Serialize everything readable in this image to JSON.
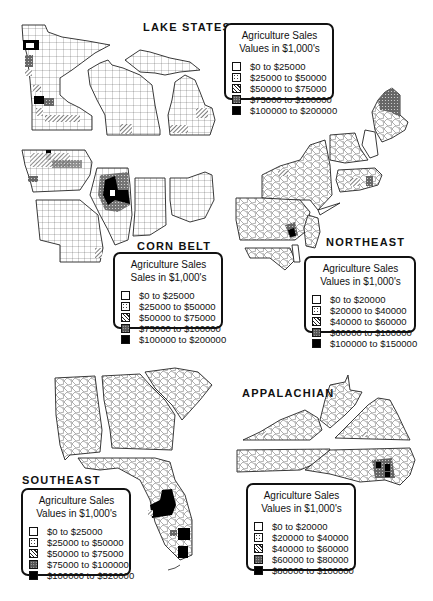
{
  "figure": "Agriculture sales by county, five regional maps",
  "regions": [
    {
      "id": "lake_states",
      "title": "LAKE STATES",
      "states": [
        "Minnesota",
        "Wisconsin",
        "Michigan"
      ],
      "legend": {
        "title_line1": "Agriculture Sales",
        "title_line2": "Values in $1,000's",
        "items": [
          {
            "label": "$0 to $25000",
            "pattern": "white"
          },
          {
            "label": "$25000 to $50000",
            "pattern": "dotted"
          },
          {
            "label": "$50000 to $75000",
            "pattern": "hatched"
          },
          {
            "label": "$75000 to $100000",
            "pattern": "crosshatch"
          },
          {
            "label": "$100000 to $200000",
            "pattern": "black"
          }
        ]
      }
    },
    {
      "id": "corn_belt",
      "title": "CORN BELT",
      "states": [
        "Iowa",
        "Missouri",
        "Illinois",
        "Indiana",
        "Ohio"
      ],
      "legend": {
        "title_line1": "Agriculture Sales",
        "title_line2": "Sales in $1,000's",
        "items": [
          {
            "label": "$0 to $25000",
            "pattern": "white"
          },
          {
            "label": "$25000 to $50000",
            "pattern": "dotted"
          },
          {
            "label": "$50000 to $75000",
            "pattern": "hatched"
          },
          {
            "label": "$75000 to $100000",
            "pattern": "crosshatch"
          },
          {
            "label": "$100000 to $200000",
            "pattern": "black"
          }
        ]
      }
    },
    {
      "id": "northeast",
      "title": "NORTHEAST",
      "states": [
        "Maine",
        "New Hampshire",
        "Vermont",
        "Massachusetts",
        "Rhode Island",
        "Connecticut",
        "New York",
        "New Jersey",
        "Pennsylvania",
        "Delaware",
        "Maryland"
      ],
      "legend": {
        "title_line1": "Agriculture Sales",
        "title_line2": "Values in $1,000's",
        "items": [
          {
            "label": "$0 to $20000",
            "pattern": "white"
          },
          {
            "label": "$20000 to $40000",
            "pattern": "dotted"
          },
          {
            "label": "$40000 to $60000",
            "pattern": "hatched"
          },
          {
            "label": "$60000 to $100000",
            "pattern": "crosshatch"
          },
          {
            "label": "$100000 to $150000",
            "pattern": "black"
          }
        ]
      }
    },
    {
      "id": "southeast",
      "title": "SOUTHEAST",
      "states": [
        "Alabama",
        "Georgia",
        "South Carolina",
        "Florida"
      ],
      "legend": {
        "title_line1": "Agriculture Sales",
        "title_line2": "Values in $1,000's",
        "items": [
          {
            "label": "$0 to $25000",
            "pattern": "white"
          },
          {
            "label": "$25000 to $50000",
            "pattern": "dotted"
          },
          {
            "label": "$50000 to $75000",
            "pattern": "hatched"
          },
          {
            "label": "$75000 to $100000",
            "pattern": "crosshatch"
          },
          {
            "label": "$100000 to $520000",
            "pattern": "black"
          }
        ]
      }
    },
    {
      "id": "appalachian",
      "title": "APPALACHIAN",
      "states": [
        "West Virginia",
        "Virginia",
        "Kentucky",
        "Tennessee",
        "North Carolina"
      ],
      "legend": {
        "title_line1": "Agriculture Sales",
        "title_line2": "Values in $1,000's",
        "items": [
          {
            "label": "$0 to $20000",
            "pattern": "white"
          },
          {
            "label": "$20000 to $40000",
            "pattern": "dotted"
          },
          {
            "label": "$40000 to $60000",
            "pattern": "hatched"
          },
          {
            "label": "$60000 to $80000",
            "pattern": "crosshatch"
          },
          {
            "label": "$80000 to $100000",
            "pattern": "black"
          }
        ]
      }
    }
  ]
}
